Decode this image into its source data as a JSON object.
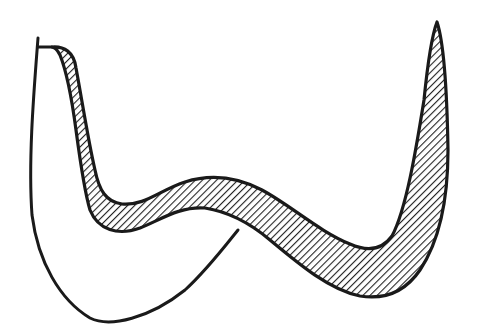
{
  "figure": {
    "colors": {
      "background": "#ffffff",
      "stroke": "#1a1a1a",
      "hatch": "#222222"
    },
    "hatch_pattern": "diagonal-lines",
    "text_labels": []
  }
}
